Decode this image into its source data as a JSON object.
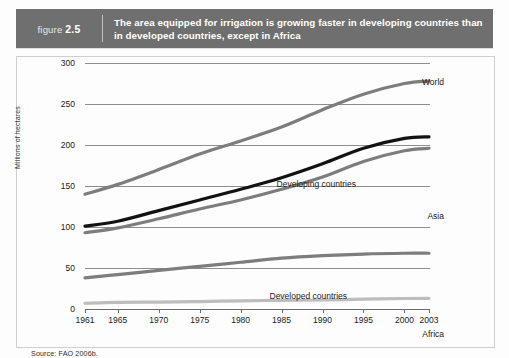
{
  "banner": {
    "figure_prefix": "figure",
    "figure_number": "2.5",
    "title": "The area equipped for irrigation is growing faster in developing countries than in developed countries, except in Africa",
    "bar_color": "#6f6f6f"
  },
  "source": "Source: FAO 2006b.",
  "chart_data": {
    "type": "line",
    "title": "The area equipped for irrigation is growing faster in developing countries than in developed countries, except in Africa",
    "xlabel": "",
    "ylabel": "Millions of hectares",
    "xlim": [
      1961,
      2003
    ],
    "ylim": [
      0,
      300
    ],
    "grid": true,
    "legend_position": "inline-right-labels",
    "xticks": [
      "1961",
      "1965",
      "1970",
      "1975",
      "1980",
      "1985",
      "1990",
      "1995",
      "2000",
      "2003"
    ],
    "xtick_values": [
      1961,
      1965,
      1970,
      1975,
      1980,
      1985,
      1990,
      1995,
      2000,
      2003
    ],
    "yticks": [
      "0",
      "50",
      "100",
      "150",
      "200",
      "250",
      "300"
    ],
    "ytick_values": [
      0,
      50,
      100,
      150,
      200,
      250,
      300
    ],
    "x": [
      1961,
      1965,
      1970,
      1975,
      1980,
      1985,
      1990,
      1995,
      2000,
      2003
    ],
    "series": [
      {
        "name": "World",
        "color": "#7d7d7d",
        "label": "World",
        "values": [
          140,
          152,
          170,
          189,
          205,
          222,
          243,
          262,
          275,
          278
        ]
      },
      {
        "name": "Developing countries",
        "color": "#121212",
        "label": "Developing countries",
        "values": [
          101,
          107,
          120,
          133,
          146,
          160,
          177,
          196,
          208,
          210
        ]
      },
      {
        "name": "Asia",
        "color": "#7d7d7d",
        "label": "Asia",
        "values": [
          93,
          99,
          110,
          122,
          133,
          146,
          161,
          180,
          193,
          196
        ]
      },
      {
        "name": "Developed countries",
        "color": "#7d7d7d",
        "label": "Developed countries",
        "values": [
          38,
          42,
          47,
          52,
          57,
          62,
          65,
          67,
          68,
          68
        ]
      },
      {
        "name": "Africa",
        "color": "#bdbdbd",
        "label": "Africa",
        "values": [
          7,
          8,
          8.5,
          9,
          10,
          10.5,
          11,
          12,
          12.8,
          13
        ]
      }
    ],
    "annotations": [
      {
        "text": "World",
        "series": "World"
      },
      {
        "text": "Developing countries",
        "series": "Developing countries"
      },
      {
        "text": "Asia",
        "series": "Asia"
      },
      {
        "text": "Developed countries",
        "series": "Developed countries"
      },
      {
        "text": "Africa",
        "series": "Africa"
      }
    ]
  }
}
